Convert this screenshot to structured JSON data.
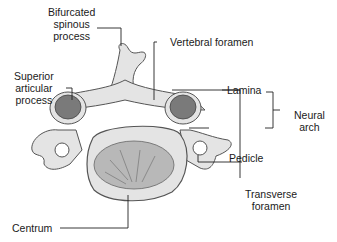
{
  "diagram": {
    "labels": {
      "bifurcated_spinous_process": [
        "Bifurcated",
        "spinous",
        "process"
      ],
      "vertebral_foramen": "Vertebral foramen",
      "superior_articular_process": [
        "Superior",
        "articular",
        "process"
      ],
      "lamina": "Lamina",
      "neural_arch": [
        "Neural",
        "arch"
      ],
      "pedicle": "Pedicle",
      "transverse_foramen": [
        "Transverse",
        "foramen"
      ],
      "centrum": "Centrum"
    },
    "colors": {
      "bone_fill": "#e4e4e4",
      "bone_shadow": "#9a9a9a",
      "articular_facet": "#7a7a7a",
      "centrum_texture": "#b8b8b8",
      "leader_line": "#222222"
    }
  }
}
